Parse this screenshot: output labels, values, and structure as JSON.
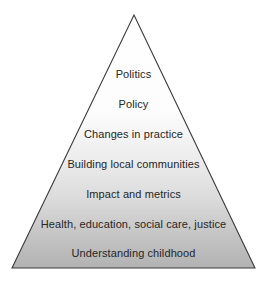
{
  "diagram": {
    "type": "pyramid",
    "shape_name": "triangle",
    "levels_count": 7,
    "levels": [
      {
        "rank": 1,
        "label": "Politics"
      },
      {
        "rank": 2,
        "label": "Policy"
      },
      {
        "rank": 3,
        "label": "Changes in practice"
      },
      {
        "rank": 4,
        "label": "Building local communities"
      },
      {
        "rank": 5,
        "label": "Impact and metrics"
      },
      {
        "rank": 6,
        "label": "Health, education, social care, justice"
      },
      {
        "rank": 7,
        "label": "Understanding childhood"
      }
    ],
    "colors": {
      "fill_top": "#ffffff",
      "fill_bottom": "#b5b5b5",
      "outline": "#3c3c3c",
      "text": "#262626",
      "background": "#ffffff"
    },
    "geometry": {
      "apex_x": 134,
      "apex_y": 15,
      "base_left_x": 12,
      "base_right_x": 255,
      "base_y": 268
    }
  }
}
